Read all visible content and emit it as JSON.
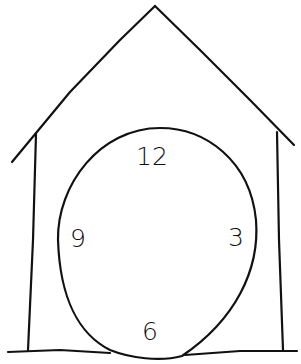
{
  "drawing": {
    "subject": "house-shaped clock sketch",
    "stroke_color": "#111111",
    "background": "#ffffff"
  },
  "clock": {
    "numerals": [
      {
        "label": "12",
        "x": 152,
        "y": 156
      },
      {
        "label": "3",
        "x": 236,
        "y": 237
      },
      {
        "label": "9",
        "x": 78,
        "y": 238
      },
      {
        "label": "6",
        "x": 150,
        "y": 331
      }
    ]
  }
}
